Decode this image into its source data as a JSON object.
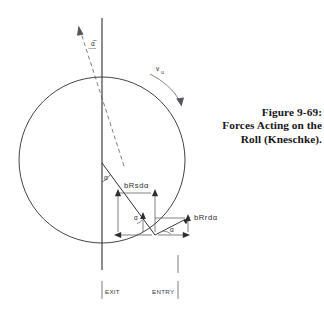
{
  "figure": {
    "caption": {
      "line1": "Figure 9-69:",
      "line2": "Forces Acting on the",
      "line3": "Roll (Kneschke)."
    },
    "diagram": {
      "type": "technical-line-diagram",
      "description": "Roll force diagram showing a circle (roll cross-section) with radial and tangential force components decomposed into rectangles",
      "labels": {
        "alpha_bar": "α̅",
        "alpha_1": "α",
        "alpha_2": "α",
        "alpha_3": "α",
        "radial_force": "bRsdα",
        "tangential_force": "bRrdα",
        "velocity": "v",
        "velocity_subscript": "u",
        "exit": "EXIT",
        "entry": "ENTRY"
      },
      "geometry": {
        "circle_center_x": 102,
        "circle_center_y": 160,
        "circle_radius": 83,
        "vertical_axis_x": 102,
        "vertical_axis_top_y": 18,
        "vertical_axis_bottom_y": 270,
        "contact_point_x": 102,
        "contact_point_y": 163,
        "force_origin_x": 155,
        "force_origin_y": 235,
        "entry_tick_x": 178,
        "exit_tick_x": 102
      },
      "colors": {
        "line": "#2e2e32",
        "thin_line": "#4a4a50",
        "dashed_line": "#5a5a60",
        "text": "#2a2a2e",
        "background": "#ffffff"
      }
    }
  }
}
